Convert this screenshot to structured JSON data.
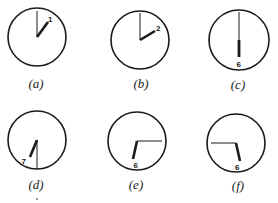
{
  "figure": {
    "colors": {
      "ink": "#1a1a1a",
      "background": "#ffffff"
    }
  },
  "clocks": [
    {
      "id": "a",
      "label": "(a)",
      "numeral": "1",
      "cx": 37,
      "cy": 37,
      "r": 29,
      "minute_hand": [
        37,
        11
      ],
      "hour_hand": [
        48,
        22
      ],
      "numeral_pos": [
        50,
        21
      ],
      "label_pos": [
        36,
        84
      ]
    },
    {
      "id": "b",
      "label": "(b)",
      "numeral": "2",
      "cx": 140,
      "cy": 40,
      "r": 29,
      "minute_hand": [
        140,
        13
      ],
      "hour_hand": [
        155,
        30
      ],
      "numeral_pos": [
        158,
        29
      ],
      "label_pos": [
        141,
        84
      ]
    },
    {
      "id": "c",
      "label": "(c)",
      "numeral": "6",
      "cx": 239,
      "cy": 40,
      "r": 30,
      "minute_hand": [
        239,
        12
      ],
      "hour_hand": [
        239,
        57
      ],
      "numeral_pos": [
        239,
        67
      ],
      "label_pos": [
        238,
        85
      ]
    },
    {
      "id": "d",
      "label": "(d)",
      "numeral": "7",
      "cx": 37,
      "cy": 140,
      "r": 29,
      "minute_hand": [
        37,
        169
      ],
      "hour_hand": [
        30,
        157
      ],
      "numeral_pos": [
        24,
        161
      ],
      "label_pos": [
        36,
        185
      ]
    },
    {
      "id": "e",
      "label": "(e)",
      "numeral": "6",
      "cx": 137,
      "cy": 141,
      "r": 29,
      "minute_hand": [
        162,
        141
      ],
      "hour_hand": [
        133,
        159
      ],
      "numeral_pos": [
        136,
        166
      ],
      "label_pos": [
        136,
        185
      ]
    },
    {
      "id": "f",
      "label": "(f)",
      "numeral": "6",
      "cx": 236,
      "cy": 143,
      "r": 29,
      "minute_hand": [
        211,
        143
      ],
      "hour_hand": [
        240,
        161
      ],
      "numeral_pos": [
        237,
        168
      ],
      "label_pos": [
        238,
        186
      ]
    }
  ]
}
